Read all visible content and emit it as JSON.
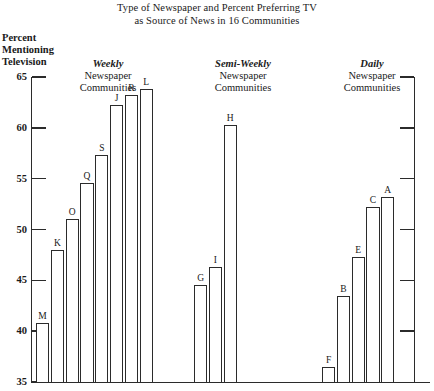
{
  "title": {
    "line1": "Type of Newspaper and Percent Preferring TV",
    "line2": "as Source of News in 16 Communities"
  },
  "axis_caption": {
    "line1": "Percent",
    "line2": "Mentioning",
    "line3": "Television"
  },
  "groups": [
    {
      "id": "weekly",
      "emphasis": "Weekly",
      "line2": "Newspaper",
      "line3": "Communities"
    },
    {
      "id": "semi-weekly",
      "emphasis": "Semi-Weekly",
      "line2": "Newspaper",
      "line3": "Communities"
    },
    {
      "id": "daily",
      "emphasis": "Daily",
      "line2": "Newspaper",
      "line3": "Communities"
    }
  ],
  "chart_data": {
    "type": "bar",
    "title": "Type of Newspaper and Percent Preferring TV as Source of News in 16 Communities",
    "xlabel": "",
    "ylabel": "Percent Mentioning Television",
    "ylim": [
      35,
      65
    ],
    "yticks": [
      35,
      40,
      45,
      50,
      55,
      60,
      65
    ],
    "ytick_labels": [
      "35",
      "40",
      "45",
      "50",
      "55",
      "60",
      "65"
    ],
    "grid": false,
    "legend": "none",
    "axis_note": "y-axis truncated, begins at 35",
    "groups": [
      {
        "name": "Weekly Newspaper Communities",
        "categories": [
          "M",
          "K",
          "O",
          "Q",
          "S",
          "J",
          "R",
          "L"
        ],
        "values": [
          40.8,
          48.0,
          51.0,
          54.6,
          57.3,
          62.2,
          63.2,
          63.8
        ]
      },
      {
        "name": "Semi-Weekly Newspaper Communities",
        "categories": [
          "G",
          "I",
          "H"
        ],
        "values": [
          44.5,
          46.3,
          60.3
        ]
      },
      {
        "name": "Daily Newspaper Communities",
        "categories": [
          "F",
          "B",
          "E",
          "C",
          "A"
        ],
        "values": [
          36.5,
          43.5,
          47.3,
          52.2,
          53.2
        ]
      }
    ]
  },
  "colors": {
    "ink": "#2b2b2b",
    "paper": "#ffffff"
  }
}
